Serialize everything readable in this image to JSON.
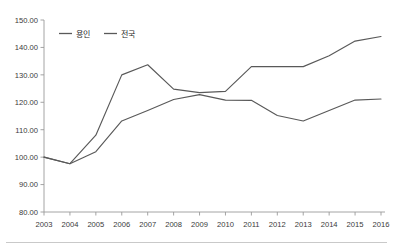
{
  "chart_data": {
    "type": "line",
    "title": "",
    "xlabel": "",
    "ylabel": "",
    "categories": [
      "2003",
      "2004",
      "2005",
      "2006",
      "2007",
      "2008",
      "2009",
      "2010",
      "2011",
      "2012",
      "2013",
      "2014",
      "2015",
      "2016"
    ],
    "x": [
      2003,
      2004,
      2005,
      2006,
      2007,
      2008,
      2009,
      2010,
      2011,
      2012,
      2013,
      2014,
      2015,
      2016
    ],
    "ylim": [
      80.0,
      150.0
    ],
    "ytick_step": 10.0,
    "ytick_labels": [
      "80.00",
      "90.00",
      "100.00",
      "110.00",
      "120.00",
      "130.00",
      "140.00",
      "150.00"
    ],
    "ytick_values": [
      80.0,
      90.0,
      100.0,
      110.0,
      120.0,
      130.0,
      140.0,
      150.0
    ],
    "grid": false,
    "legend_position": "top-left",
    "series": [
      {
        "name": "용인",
        "color": "#595959",
        "values": [
          100.0,
          97.6,
          102.0,
          113.2,
          117.0,
          121.0,
          122.8,
          120.8,
          120.7,
          115.2,
          113.2,
          117.0,
          120.8,
          121.2
        ]
      },
      {
        "name": "전국",
        "color": "#595959",
        "values": [
          100.0,
          97.6,
          108.0,
          130.0,
          133.7,
          124.8,
          123.5,
          124.0,
          133.0,
          133.0,
          133.0,
          137.0,
          142.3,
          144.0
        ]
      }
    ]
  },
  "legend": {
    "items": [
      {
        "label": "용인",
        "color": "#595959"
      },
      {
        "label": "전국",
        "color": "#595959"
      }
    ]
  },
  "axes": {
    "axis_color": "#9a9a9a",
    "tick_text_color": "#3a3a3a"
  }
}
